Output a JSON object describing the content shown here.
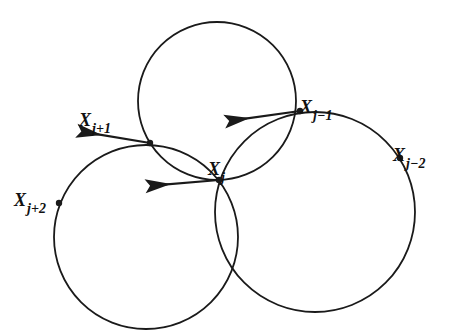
{
  "colors": {
    "stroke": "#1a1a1a",
    "background": "#ffffff"
  },
  "circles": [
    {
      "id": "top",
      "cx": 217,
      "cy": 101,
      "r": 79
    },
    {
      "id": "left",
      "cx": 146,
      "cy": 237,
      "r": 92
    },
    {
      "id": "right",
      "cx": 315,
      "cy": 212,
      "r": 100
    }
  ],
  "points": [
    {
      "id": "xj2p",
      "x": 59,
      "y": 203,
      "base": "X",
      "sub": "j+2",
      "lx": 14,
      "ly": 190
    },
    {
      "id": "xj1p",
      "x": 150,
      "y": 143,
      "base": "X",
      "sub": "j+1",
      "lx": 79,
      "ly": 110
    },
    {
      "id": "xj",
      "x": 219,
      "y": 180,
      "base": "X",
      "sub": "j",
      "lx": 208,
      "ly": 159
    },
    {
      "id": "xj1m",
      "x": 300,
      "y": 111,
      "base": "X",
      "sub": "j−1",
      "lx": 300,
      "ly": 97
    },
    {
      "id": "xj2m",
      "x": 400,
      "y": 158,
      "base": "X",
      "sub": "j−2",
      "lx": 393,
      "ly": 145
    }
  ],
  "arrows": [
    {
      "id": "arrow-at-xj1m",
      "tipx": 250,
      "tipy": 118,
      "fromx": 300,
      "fromy": 111
    },
    {
      "id": "arrow-at-xj1p",
      "tipx": 102,
      "tipy": 135,
      "fromx": 150,
      "fromy": 143
    },
    {
      "id": "arrow-at-xj",
      "tipx": 171,
      "tipy": 184,
      "fromx": 219,
      "fromy": 180
    }
  ]
}
